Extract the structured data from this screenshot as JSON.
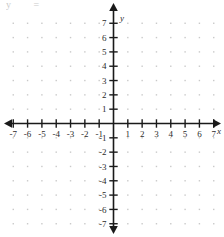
{
  "figure": {
    "title_fragment": "y  = ",
    "axis_labels": {
      "x": "x",
      "y": "y"
    }
  },
  "chart_data": {
    "type": "scatter",
    "title": "",
    "subtitle": "",
    "xlabel": "x",
    "ylabel": "y",
    "xlim": [
      -7.6,
      7.6
    ],
    "ylim": [
      -7.6,
      7.6
    ],
    "grid": true,
    "grid_style": "dotted",
    "grid_step": 1,
    "legend": "none",
    "series": [
      {
        "name": "plotted points",
        "x": [],
        "y": []
      }
    ],
    "x_ticks": [
      -7,
      -6,
      -5,
      -4,
      -3,
      -2,
      -1,
      1,
      2,
      3,
      4,
      5,
      6,
      7
    ],
    "y_ticks": [
      7,
      6,
      5,
      4,
      3,
      2,
      1,
      -1,
      -2,
      -3,
      -4,
      -5,
      -6,
      -7
    ],
    "x_tick_labels": [
      "-7",
      "-6",
      "-5",
      "-4",
      "-3",
      "-2",
      "-1",
      "1",
      "2",
      "3",
      "4",
      "5",
      "6",
      "7"
    ],
    "y_tick_labels": [
      "7",
      "6",
      "5",
      "4",
      "3",
      "2",
      "1",
      "-1",
      "-2",
      "-3",
      "-4",
      "-5",
      "-6",
      "-7"
    ],
    "arrows": [
      "left",
      "right",
      "up",
      "down"
    ],
    "origin_labeled": false,
    "colors": {
      "axis": "#1a1a1a",
      "grid_dot": "#c9c9c9",
      "text": "#2b2b2b",
      "background": "#ffffff"
    }
  }
}
